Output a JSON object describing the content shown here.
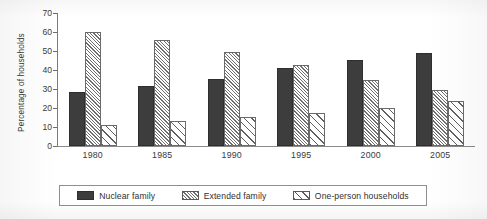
{
  "chart_data": {
    "type": "bar",
    "title": "",
    "subtitle": "",
    "xlabel": "",
    "ylabel": "Percentage of households",
    "categories": [
      "1980",
      "1985",
      "1990",
      "1995",
      "2000",
      "2005"
    ],
    "series": [
      {
        "name": "Nuclear family",
        "pattern": "solid-dark",
        "values": [
          28.5,
          31.5,
          35.5,
          41.0,
          45.5,
          49.0
        ]
      },
      {
        "name": "Extended family",
        "pattern": "fine-hatch",
        "values": [
          60.0,
          56.0,
          49.5,
          42.5,
          35.0,
          29.5
        ]
      },
      {
        "name": "One-person households",
        "pattern": "coarse-hatch",
        "values": [
          11.0,
          13.0,
          15.5,
          17.5,
          20.0,
          23.5
        ]
      }
    ],
    "ylim": [
      0,
      70
    ],
    "ytick_values": [
      0,
      10,
      20,
      30,
      40,
      50,
      60,
      70
    ],
    "ytick_labels": [
      "0",
      "10",
      "20",
      "30",
      "40",
      "50",
      "60",
      "70"
    ],
    "grid": false,
    "legend_position": "bottom",
    "colors": {
      "nuclear": "#3d3d3d",
      "extended_hatch": "#6f6f6f",
      "oneperson_hatch": "#5f5f5f",
      "axis": "#7a7a7a",
      "text": "#3a3a3a",
      "background": "#ffffff"
    }
  },
  "legend": {
    "items": [
      {
        "label": "Nuclear family"
      },
      {
        "label": "Extended family"
      },
      {
        "label": "One-person households"
      }
    ]
  }
}
